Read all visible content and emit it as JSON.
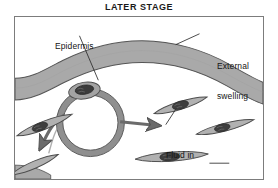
{
  "figure": {
    "title": "LATER STAGE",
    "type": "medical-illustration",
    "colors": {
      "epidermis_fill": "#a8a8a8",
      "outline": "#4a4a4a",
      "cell_fill": "#b0b0b0",
      "nucleus_fill": "#3c3c3c",
      "background": "#ffffff",
      "frame_border": "#7c7c7c",
      "text": "#151515"
    }
  },
  "labels": {
    "epidermis": {
      "text": "Epidermis",
      "lines": [
        "Epidermis"
      ]
    },
    "external_swelling": {
      "text": "External swelling",
      "lines": [
        "External",
        "swelling"
      ]
    },
    "fluid_interstitial": {
      "text": "Fluid in interstitial space",
      "lines": [
        "Fluid in",
        "interstitial",
        "space"
      ]
    },
    "slight_swelling": {
      "text": "Slight swelling",
      "lines": [
        "Slight",
        "swelling"
      ]
    }
  },
  "structures": {
    "epidermis_band": "arched wavy gray band spanning full width",
    "capillary": "circular vessel cross-section with endothelial nucleus at top",
    "arrows": [
      "fluid-outflow-right",
      "fluid-outflow-lower-left"
    ],
    "cells": [
      "spindle-cell-left-upper",
      "spindle-cell-left-lower",
      "spindle-cell-top-right",
      "spindle-cell-right",
      "spindle-cell-bottom-center"
    ]
  }
}
